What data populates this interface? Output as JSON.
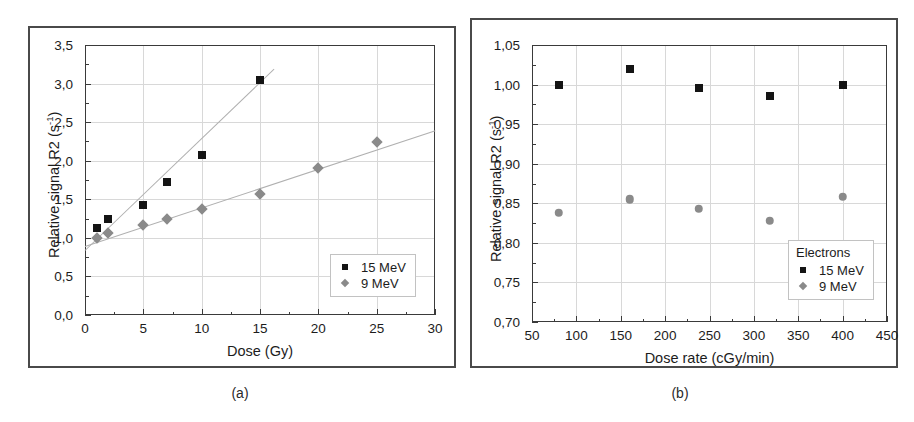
{
  "figure": {
    "panels": [
      {
        "id": "a",
        "caption": "(a)"
      },
      {
        "id": "b",
        "caption": "(b)"
      }
    ]
  },
  "chart_data": [
    {
      "type": "scatter",
      "panel": "a",
      "title": "",
      "xlabel": "Dose (Gy)",
      "ylabel": "Relative signal R2 (s",
      "ylabel_sup": "-1",
      "ylabel_suffix": ")",
      "xlim": [
        0,
        30
      ],
      "ylim": [
        0.0,
        3.5
      ],
      "xticks": [
        0,
        5,
        10,
        15,
        20,
        25,
        30
      ],
      "xticklabels": [
        "0",
        "5",
        "10",
        "15",
        "20",
        "25",
        "30"
      ],
      "yticks": [
        0.0,
        0.5,
        1.0,
        1.5,
        2.0,
        2.5,
        3.0,
        3.5
      ],
      "yticklabels": [
        "0,0",
        "0,5",
        "1,0",
        "1,5",
        "2,0",
        "2,5",
        "3,0",
        "3,5"
      ],
      "grid": true,
      "legend_position": "lower-right",
      "legend_title": "",
      "series": [
        {
          "name": "15 MeV",
          "marker": "square",
          "color": "#141414",
          "x": [
            1,
            2,
            5,
            7,
            10,
            15
          ],
          "y": [
            1.13,
            1.25,
            1.42,
            1.73,
            2.08,
            3.04
          ],
          "fit": {
            "x0": 0,
            "y0": 0.84,
            "x1": 16.2,
            "y1": 3.19
          }
        },
        {
          "name": "9 MeV",
          "marker": "diamond",
          "color": "#8a8a8a",
          "x": [
            1,
            2,
            5,
            7,
            10,
            15,
            20,
            25
          ],
          "y": [
            1.0,
            1.06,
            1.17,
            1.25,
            1.38,
            1.57,
            1.9,
            2.24
          ],
          "fit": {
            "x0": 0,
            "y0": 0.9,
            "x1": 30,
            "y1": 2.4
          }
        }
      ]
    },
    {
      "type": "scatter",
      "panel": "b",
      "title": "",
      "xlabel": "Dose rate (cGy/min)",
      "ylabel": "Relative signal R2 (s",
      "ylabel_sup": "-1",
      "ylabel_suffix": ")",
      "xlim": [
        50,
        450
      ],
      "ylim": [
        0.7,
        1.05
      ],
      "xticks": [
        50,
        100,
        150,
        200,
        250,
        300,
        350,
        400,
        450
      ],
      "xticklabels": [
        "50",
        "100",
        "150",
        "200",
        "250",
        "300",
        "350",
        "400",
        "450"
      ],
      "yticks": [
        0.7,
        0.75,
        0.8,
        0.85,
        0.9,
        0.95,
        1.0,
        1.05
      ],
      "yticklabels": [
        "0,70",
        "0,75",
        "0,80",
        "0,85",
        "0,90",
        "0,95",
        "1,00",
        "1,05"
      ],
      "grid": true,
      "legend_position": "lower-right",
      "legend_title": "Electrons",
      "series": [
        {
          "name": "15 MeV",
          "marker": "square",
          "color": "#141414",
          "x": [
            80,
            160,
            238,
            318,
            400
          ],
          "y": [
            1.0,
            1.02,
            0.996,
            0.986,
            1.0
          ],
          "fit": null
        },
        {
          "name": "9 MeV",
          "marker": "circle",
          "color": "#8a8a8a",
          "x": [
            80,
            160,
            238,
            318,
            400
          ],
          "y": [
            0.838,
            0.855,
            0.843,
            0.828,
            0.858
          ],
          "fit": null
        }
      ]
    }
  ]
}
